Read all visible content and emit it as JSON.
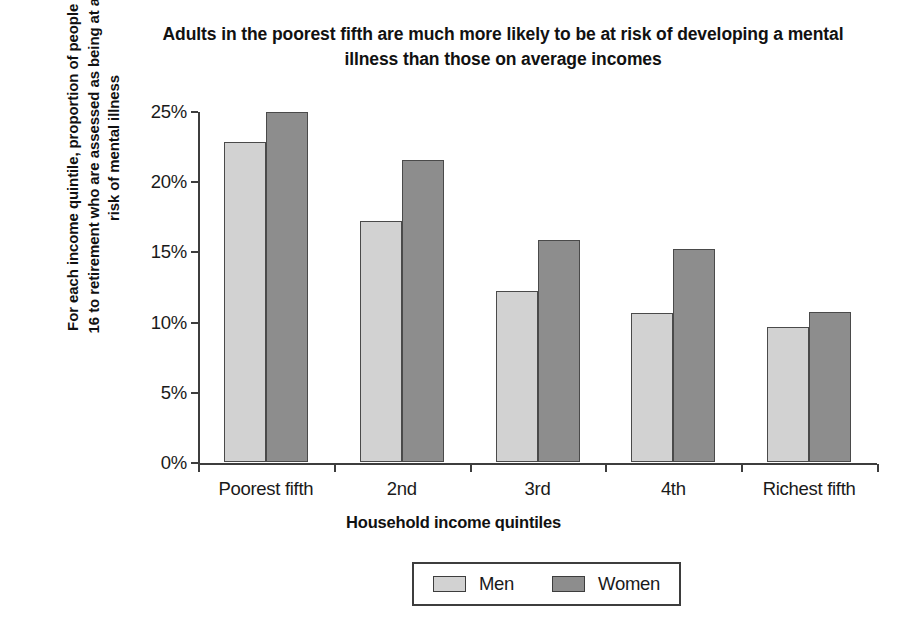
{
  "chart_data": {
    "type": "bar",
    "title": "Adults in the poorest fifth are much more likely to be at risk of developing a mental illness than those on average incomes",
    "xlabel": "Household income quintiles",
    "ylabel": "For each income quintile, proportion of people aged 16 to retirement who are assessed as being at a high risk of mental illness",
    "categories": [
      "Poorest fifth",
      "2nd",
      "3rd",
      "4th",
      "Richest fifth"
    ],
    "series": [
      {
        "name": "Men",
        "color": "#d2d2d2",
        "values": [
          22.8,
          17.2,
          12.2,
          10.6,
          9.6
        ]
      },
      {
        "name": "Women",
        "color": "#8d8d8d",
        "values": [
          24.9,
          21.5,
          15.8,
          15.2,
          10.7
        ]
      }
    ],
    "ylim": [
      0,
      25
    ],
    "ytick_values": [
      0,
      5,
      10,
      15,
      20,
      25
    ],
    "ytick_labels": [
      "0%",
      "5%",
      "10%",
      "15%",
      "20%",
      "25%"
    ],
    "grid": false,
    "legend_position": "bottom-center"
  }
}
